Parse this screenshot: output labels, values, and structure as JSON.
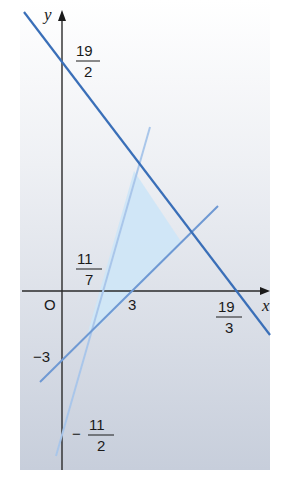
{
  "diagram": {
    "type": "linear-programming-graph",
    "colors": {
      "background_top": "#ffffff",
      "background_bottom": "#c9d0dc",
      "axis": "#2a2a2a",
      "line_dark": "#3a6fb8",
      "line_mid": "#6f99d3",
      "line_light": "#a9c6ea",
      "feasible_region": "#cfe6f7"
    },
    "axes": {
      "x_label": "x",
      "y_label": "y",
      "origin_label": "O"
    },
    "labels": {
      "y_intercept_dark": {
        "num": "19",
        "den": "2"
      },
      "x_intercept_dark": {
        "num": "19",
        "den": "3"
      },
      "x_intercept_light": {
        "num": "11",
        "den": "7"
      },
      "x_intercept_mid": "3",
      "y_intercept_mid": "−3",
      "y_intercept_light": {
        "sign": "−",
        "num": "11",
        "den": "2"
      }
    },
    "lines": [
      {
        "name": "line-1",
        "equation": "3x + 2y = 19",
        "x_intercept": "19/3",
        "y_intercept": "19/2"
      },
      {
        "name": "line-2",
        "equation": "y = x − 3",
        "x_intercept": "3",
        "y_intercept": "−3"
      },
      {
        "name": "line-3",
        "equation": "7y = 2(... ) / y = 3.5x − 5.5",
        "x_intercept": "11/7",
        "y_intercept": "−11/2"
      }
    ],
    "feasible_region_vertices": [
      {
        "x": 1,
        "y": -2
      },
      {
        "x": 3,
        "y": 5
      },
      {
        "x": 5,
        "y": 2
      }
    ]
  }
}
